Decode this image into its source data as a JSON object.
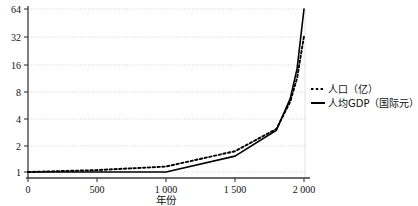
{
  "chart_data": {
    "type": "line",
    "title": "",
    "xlabel": "年份",
    "ylabel": "",
    "xlim": [
      0,
      2050
    ],
    "ylim": [
      1,
      64
    ],
    "yscale": "log2",
    "grid": true,
    "legend_position": "right-middle",
    "x_ticks": [
      {
        "value": 0,
        "label": "0"
      },
      {
        "value": 500,
        "label": "500"
      },
      {
        "value": 1000,
        "label": "1 000"
      },
      {
        "value": 1500,
        "label": "1 500"
      },
      {
        "value": 2000,
        "label": "2 000"
      }
    ],
    "y_ticks": [
      {
        "value": 1,
        "label": "1"
      },
      {
        "value": 2,
        "label": "2"
      },
      {
        "value": 4,
        "label": "4"
      },
      {
        "value": 8,
        "label": "8"
      },
      {
        "value": 16,
        "label": "16"
      },
      {
        "value": 32,
        "label": "32"
      },
      {
        "value": 64,
        "label": "64"
      }
    ],
    "series": [
      {
        "name": "人口（亿）",
        "style": "dotted",
        "color": "#000000",
        "points": [
          {
            "x": 0,
            "y": 1.0
          },
          {
            "x": 500,
            "y": 1.05
          },
          {
            "x": 1000,
            "y": 1.15
          },
          {
            "x": 1500,
            "y": 1.7
          },
          {
            "x": 1800,
            "y": 3.0
          },
          {
            "x": 1900,
            "y": 6.0
          },
          {
            "x": 1950,
            "y": 11.0
          },
          {
            "x": 2000,
            "y": 32.0
          }
        ]
      },
      {
        "name": "人均GDP（国际元）",
        "style": "solid",
        "color": "#000000",
        "points": [
          {
            "x": 0,
            "y": 1.0
          },
          {
            "x": 500,
            "y": 1.0
          },
          {
            "x": 1000,
            "y": 1.0
          },
          {
            "x": 1500,
            "y": 1.5
          },
          {
            "x": 1800,
            "y": 2.9
          },
          {
            "x": 1900,
            "y": 6.5
          },
          {
            "x": 1950,
            "y": 14.0
          },
          {
            "x": 2000,
            "y": 64.0
          }
        ]
      }
    ],
    "legend": [
      {
        "label": "人口（亿）",
        "style": "dotted"
      },
      {
        "label": "人均GDP（国际元）",
        "style": "solid"
      }
    ]
  }
}
